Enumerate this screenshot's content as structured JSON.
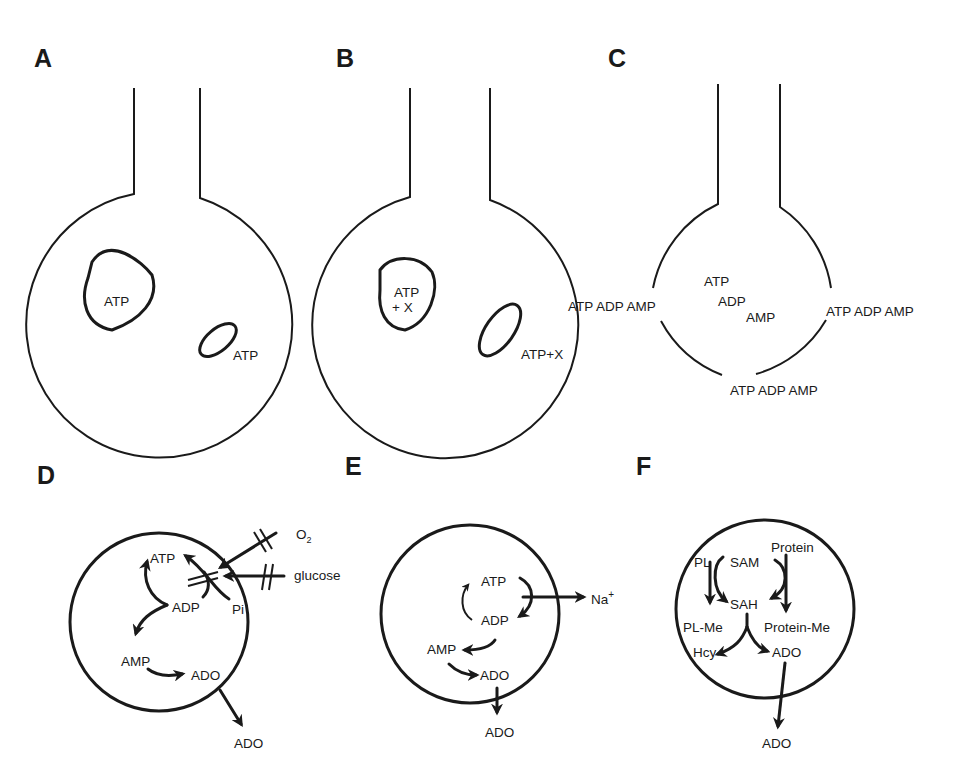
{
  "figure": {
    "panels": {
      "A": {
        "label": "A",
        "description": "Nerve terminal with ATP stored in vesicle and released at membrane",
        "vesicle_label": "ATP",
        "release_label": "ATP"
      },
      "B": {
        "label": "B",
        "description": "Nerve terminal with ATP co-stored with another transmitter X",
        "vesicle_label_line1": "ATP",
        "vesicle_label_line2": "+ X",
        "release_label": "ATP+X"
      },
      "C": {
        "label": "C",
        "description": "Leaky/damaged cell releasing cytoplasmic nucleotides",
        "inside": {
          "atp": "ATP",
          "adp": "ADP",
          "amp": "AMP"
        },
        "left_release": "ATP ADP AMP",
        "right_release": "ATP ADP AMP",
        "bottom_release": "ATP ADP AMP"
      },
      "D": {
        "label": "D",
        "description": "Hypoxia/hypoglycemia: blocked O2 and glucose reduce ATP resynthesis, leading to ADO formation",
        "nodes": {
          "atp": "ATP",
          "adp": "ADP",
          "pi": "Pi",
          "amp": "AMP",
          "ado_inside": "ADO",
          "ado_outside": "ADO"
        },
        "inputs": {
          "oxygen": "O",
          "oxygen_subscript": "2",
          "glucose": "glucose"
        }
      },
      "E": {
        "label": "E",
        "description": "Increased ATP consumption by Na+ pumping leading to ADO formation",
        "nodes": {
          "atp": "ATP",
          "adp": "ADP",
          "amp": "AMP",
          "ado_inside": "ADO",
          "ado_outside": "ADO"
        },
        "ion": "Na",
        "ion_charge": "+"
      },
      "F": {
        "label": "F",
        "description": "Transmethylation pathway: SAM to SAH, hydrolysis to Hcy and ADO",
        "nodes": {
          "pl": "PL",
          "sam": "SAM",
          "protein": "Protein",
          "sah": "SAH",
          "pl_me": "PL-Me",
          "protein_me": "Protein-Me",
          "hcy": "Hcy",
          "ado_inside": "ADO",
          "ado_outside": "ADO"
        }
      }
    },
    "colors": {
      "ink": "#1a1a1a",
      "background": "#ffffff"
    }
  }
}
